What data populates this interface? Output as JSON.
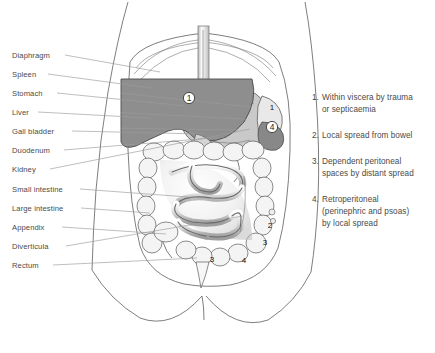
{
  "figure": {
    "background_color": "#ffffff"
  },
  "labels": {
    "items": [
      {
        "text": "Diaphragm",
        "x": 12,
        "y": 58,
        "line_x1": 65,
        "line_y1": 55,
        "line_x2": 160,
        "line_y2": 72
      },
      {
        "text": "Spleen",
        "x": 12,
        "y": 77,
        "line_x1": 48,
        "line_y1": 74,
        "line_x2": 152,
        "line_y2": 88
      },
      {
        "text": "Stomach",
        "x": 12,
        "y": 96,
        "line_x1": 57,
        "line_y1": 93,
        "line_x2": 186,
        "line_y2": 106
      },
      {
        "text": "Liver",
        "x": 12,
        "y": 115,
        "line_x1": 38,
        "line_y1": 112,
        "line_x2": 150,
        "line_y2": 118
      },
      {
        "text": "Gall bladder",
        "x": 12,
        "y": 134,
        "line_x1": 72,
        "line_y1": 131,
        "line_x2": 203,
        "line_y2": 134
      },
      {
        "text": "Duodenum",
        "x": 12,
        "y": 153,
        "line_x1": 64,
        "line_y1": 150,
        "line_x2": 224,
        "line_y2": 137
      },
      {
        "text": "Kidney",
        "x": 12,
        "y": 172,
        "line_x1": 50,
        "line_y1": 169,
        "line_x2": 250,
        "line_y2": 129
      },
      {
        "text": "Small intestine",
        "x": 12,
        "y": 192,
        "line_x1": 80,
        "line_y1": 189,
        "line_x2": 215,
        "line_y2": 199
      },
      {
        "text": "Large intestine",
        "x": 12,
        "y": 211,
        "line_x1": 81,
        "line_y1": 208,
        "line_x2": 150,
        "line_y2": 213
      },
      {
        "text": "Appendix",
        "x": 12,
        "y": 230,
        "line_x1": 62,
        "line_y1": 227,
        "line_x2": 166,
        "line_y2": 234
      },
      {
        "text": "Diverticula",
        "x": 12,
        "y": 249,
        "line_x1": 66,
        "line_y1": 246,
        "line_x2": 243,
        "line_y2": 216
      },
      {
        "text": "Rectum",
        "x": 12,
        "y": 268,
        "line_x1": 53,
        "line_y1": 265,
        "line_x2": 197,
        "line_y2": 258
      }
    ]
  },
  "legend": {
    "items": [
      {
        "number": "1.",
        "lines": [
          "Within viscera by trauma",
          "or septicaemia"
        ]
      },
      {
        "number": "2.",
        "lines": [
          "Local spread from bowel"
        ]
      },
      {
        "number": "3.",
        "lines": [
          "Dependent peritoneal",
          "spaces by distant spread"
        ]
      },
      {
        "number": "4.",
        "lines": [
          "Retroperitoneal",
          "(perinephric and psoas)",
          "by local spread"
        ]
      }
    ]
  },
  "markers": [
    {
      "id": "liver-marker",
      "text": "1",
      "x": 189,
      "y": 101,
      "circled": true
    },
    {
      "id": "right-flank-marker",
      "text": "1",
      "x": 272,
      "y": 110,
      "circled": false
    },
    {
      "id": "retro-marker",
      "text": "4",
      "x": 272,
      "y": 130,
      "circled": true
    },
    {
      "id": "bowel-marker",
      "text": "2",
      "x": 270,
      "y": 228,
      "circled": false
    },
    {
      "id": "paracolic-marker",
      "text": "3",
      "x": 265,
      "y": 245,
      "circled": false
    },
    {
      "id": "pelvic-marker",
      "text": "3",
      "x": 212,
      "y": 262,
      "circled": false
    },
    {
      "id": "psoas-marker",
      "text": "4",
      "x": 244,
      "y": 263,
      "circled": false
    }
  ],
  "colors": {
    "liver_fill": "#8e8e8e",
    "stomach_fill": "#c9c9c9",
    "bowel_fill": "#f2f2f2",
    "outline": "#6f6f6f",
    "leader": "#9a9a9a",
    "text": "#4a4a4a"
  }
}
